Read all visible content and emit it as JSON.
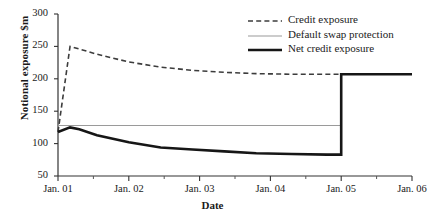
{
  "chart_data": {
    "type": "line",
    "title": "",
    "xlabel": "Date",
    "ylabel": "Notional exposure $m",
    "xlim": [
      0,
      5
    ],
    "ylim": [
      50,
      300
    ],
    "grid": false,
    "legend_position": "top-right",
    "x_tick_labels": [
      "Jan. 01",
      "Jan. 02",
      "Jan. 03",
      "Jan. 04",
      "Jan. 05",
      "Jan. 06"
    ],
    "x_tick_values": [
      0,
      1,
      2,
      3,
      4,
      5
    ],
    "x_minor_tick_values": [
      0.5,
      1.5,
      2.5,
      3.5,
      4.5
    ],
    "y_tick_labels": [
      "300",
      "250",
      "200",
      "150",
      "100",
      "50"
    ],
    "y_tick_values": [
      300,
      250,
      200,
      150,
      100,
      50
    ],
    "series": [
      {
        "name": "Credit exposure",
        "style": "dashed",
        "color": "#3c3c3c",
        "width": 1.6,
        "x": [
          0,
          0.17,
          0.3,
          0.55,
          1.0,
          1.45,
          1.9,
          2.35,
          2.8,
          3.3,
          3.8,
          4.0,
          4.4,
          5.0
        ],
        "values": [
          118,
          250,
          246,
          238,
          226,
          218,
          213,
          210,
          208,
          207,
          207,
          207,
          207,
          207
        ]
      },
      {
        "name": "Default swap protection",
        "style": "solid-thin",
        "color": "#9a9a9a",
        "width": 1.1,
        "x": [
          0,
          1.0,
          2.0,
          3.0,
          4.0
        ],
        "values": [
          128,
          128,
          128,
          128,
          128
        ]
      },
      {
        "name": "Net credit exposure",
        "style": "solid-thick",
        "color": "#161616",
        "width": 2.6,
        "x": [
          0,
          0.17,
          0.3,
          0.55,
          1.0,
          1.45,
          1.9,
          2.35,
          2.8,
          3.3,
          3.8,
          4.0,
          4.0,
          4.4,
          5.0
        ],
        "values": [
          118,
          125,
          122,
          113,
          102,
          94,
          91,
          88,
          85,
          84,
          83,
          83,
          207,
          207,
          207
        ]
      }
    ]
  },
  "legend": {
    "items": [
      {
        "label": "Credit exposure",
        "key": "dashed"
      },
      {
        "label": "Default swap protection",
        "key": "solid-thin"
      },
      {
        "label": "Net credit exposure",
        "key": "solid-thick"
      }
    ]
  }
}
